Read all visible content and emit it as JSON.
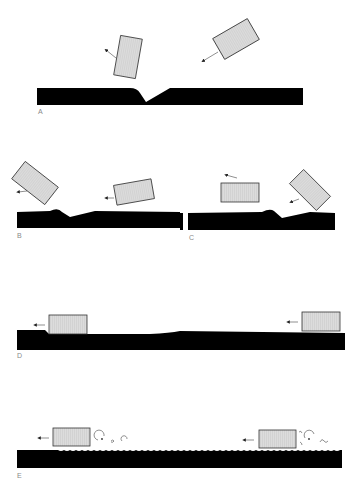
{
  "figure": {
    "colors": {
      "surface": "#000000",
      "block_fill": "#d8d8d8",
      "block_stroke": "#333333",
      "arrow": "#222222",
      "label": "#8a8a8a"
    },
    "panels": [
      {
        "id": "A",
        "label": "A",
        "caption": "Block strikes surface at an angle, creating a crater, and rebounds"
      },
      {
        "id": "B",
        "label": "B",
        "caption": "Block deflects after raising a ridge on the surface"
      },
      {
        "id": "C",
        "label": "C",
        "caption": "Tilted block impacts leaving a bump; flat block skims off"
      },
      {
        "id": "D",
        "label": "D",
        "caption": "Block slides flat across the surface leaving a gentle wave"
      },
      {
        "id": "E",
        "label": "E",
        "caption": "Block skims with turbulent vortices rippling the surface"
      }
    ]
  }
}
